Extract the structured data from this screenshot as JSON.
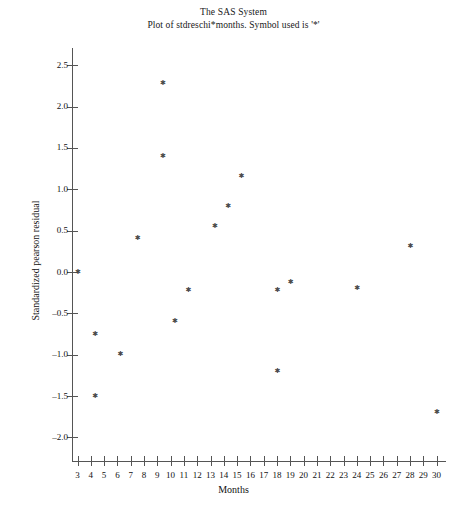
{
  "title": {
    "line1": "The SAS System",
    "line2": "Plot of stdreschi*months. Symbol used is '*'"
  },
  "chart_data": {
    "type": "scatter",
    "title": "The SAS System",
    "subtitle": "Plot of stdreschi*months. Symbol used is '*'",
    "xlabel": "Months",
    "ylabel": "Standardized pearson residual",
    "symbol": "*",
    "xlim": [
      2.4,
      30.6
    ],
    "ylim": [
      -2.25,
      2.75
    ],
    "xticks": [
      3,
      4,
      5,
      6,
      7,
      8,
      9,
      10,
      11,
      12,
      13,
      14,
      15,
      16,
      17,
      18,
      19,
      20,
      21,
      22,
      23,
      24,
      25,
      26,
      27,
      28,
      29,
      30
    ],
    "xtick_labels": [
      "3",
      "4",
      "5",
      "6",
      "7",
      "8",
      "9",
      "10",
      "11",
      "12",
      "13",
      "14",
      "15",
      "16",
      "17",
      "18",
      "19",
      "20",
      "21",
      "22",
      "23",
      "24",
      "25",
      "26",
      "27",
      "28",
      "29",
      "30"
    ],
    "yticks": [
      -2.0,
      -1.5,
      -1.0,
      -0.5,
      0.0,
      0.5,
      1.0,
      1.5,
      2.0,
      2.5
    ],
    "ytick_labels": [
      "-2.0",
      "-1.5",
      "-1.0",
      "-0.5",
      "0.0",
      "0.5",
      "1.0",
      "1.5",
      "2.0",
      "2.5"
    ],
    "grid": false,
    "legend": false,
    "point_color": "#4a4a4a",
    "axis_color": "#555555",
    "x": [
      3.0,
      4.3,
      4.3,
      6.2,
      7.5,
      9.4,
      9.4,
      10.3,
      11.3,
      13.3,
      14.3,
      15.3,
      18.0,
      18.0,
      19.0,
      24.0,
      28.0,
      30.0
    ],
    "y": [
      0.0,
      -0.75,
      -1.5,
      -1.0,
      0.4,
      2.28,
      1.4,
      -0.6,
      -0.22,
      0.55,
      0.79,
      1.16,
      -0.22,
      -1.2,
      -0.13,
      -0.2,
      0.31,
      -1.7
    ],
    "points": [
      {
        "x": 3.0,
        "y": 0.0
      },
      {
        "x": 4.3,
        "y": -0.75
      },
      {
        "x": 4.3,
        "y": -1.5
      },
      {
        "x": 6.2,
        "y": -1.0
      },
      {
        "x": 7.5,
        "y": 0.4
      },
      {
        "x": 9.4,
        "y": 2.28
      },
      {
        "x": 9.4,
        "y": 1.4
      },
      {
        "x": 10.3,
        "y": -0.6
      },
      {
        "x": 11.3,
        "y": -0.22
      },
      {
        "x": 13.3,
        "y": 0.55
      },
      {
        "x": 14.3,
        "y": 0.79
      },
      {
        "x": 15.3,
        "y": 1.16
      },
      {
        "x": 18.0,
        "y": -0.22
      },
      {
        "x": 18.0,
        "y": -1.2
      },
      {
        "x": 19.0,
        "y": -0.13
      },
      {
        "x": 24.0,
        "y": -0.2
      },
      {
        "x": 28.0,
        "y": 0.31
      },
      {
        "x": 30.0,
        "y": -1.7
      }
    ]
  }
}
